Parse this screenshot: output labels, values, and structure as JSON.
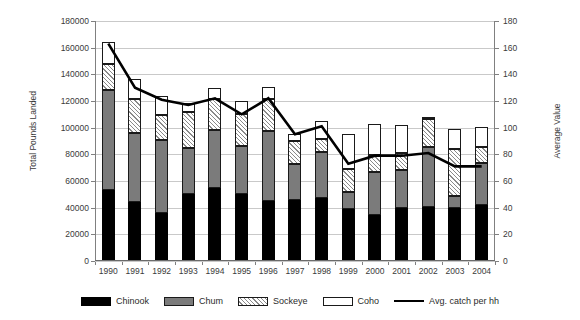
{
  "chart_data": {
    "type": "bar",
    "title": "",
    "subtitle": "",
    "xlabel": "",
    "ylabel": "Total Pounds Landed",
    "y2label": "Average Value",
    "ylim": [
      0,
      180000
    ],
    "y2lim": [
      0,
      180
    ],
    "grid": true,
    "legend_position": "bottom",
    "stacked": true,
    "categories": [
      "1990",
      "1991",
      "1992",
      "1993",
      "1994",
      "1995",
      "1996",
      "1997",
      "1998",
      "1999",
      "2000",
      "2001",
      "2002",
      "2003",
      "2004"
    ],
    "yticks": [
      0,
      20000,
      40000,
      60000,
      80000,
      100000,
      120000,
      140000,
      160000,
      180000
    ],
    "ytick_labels": [
      "0",
      "20000",
      "40000",
      "60000",
      "80000",
      "100000",
      "120000",
      "140000",
      "160000",
      "180000"
    ],
    "y2ticks": [
      0,
      20,
      40,
      60,
      80,
      100,
      120,
      140,
      160,
      180
    ],
    "y2tick_labels": [
      "0",
      "20",
      "40",
      "60",
      "80",
      "100",
      "120",
      "140",
      "160",
      "180"
    ],
    "series": [
      {
        "name": "Chinook",
        "axis": "left",
        "type": "bar",
        "color": "#000000",
        "values": [
          53500,
          44000,
          36000,
          50000,
          55000,
          50000,
          45000,
          46000,
          47000,
          39000,
          34500,
          39500,
          40500,
          39500,
          42000
        ]
      },
      {
        "name": "Chum",
        "axis": "left",
        "type": "bar",
        "color": "#7b7b7b",
        "values": [
          75000,
          52000,
          54500,
          34500,
          43000,
          36500,
          52500,
          26500,
          35000,
          13000,
          32500,
          28500,
          45000,
          9500,
          31500
        ]
      },
      {
        "name": "Sockeye",
        "axis": "left",
        "type": "bar",
        "color": "#ffffff-hatched",
        "values": [
          19500,
          25500,
          19000,
          27000,
          23500,
          24000,
          24000,
          17500,
          9500,
          17000,
          12500,
          13000,
          21000,
          35000,
          12000
        ]
      },
      {
        "name": "Coho",
        "axis": "left",
        "type": "bar",
        "color": "#ffffff",
        "values": [
          16000,
          15000,
          14000,
          7000,
          8500,
          9500,
          9000,
          5000,
          13500,
          26000,
          23000,
          21000,
          1000,
          15000,
          15000
        ]
      },
      {
        "name": "Avg. catch per hh",
        "axis": "right",
        "type": "line",
        "color": "#000000",
        "values": [
          163,
          130,
          121,
          117,
          122,
          110,
          122,
          95,
          101,
          73,
          79,
          79,
          81,
          71,
          71
        ]
      }
    ],
    "bar_totals": [
      164000,
      136500,
      123500,
      118500,
      130000,
      120000,
      130500,
      95000,
      105000,
      95000,
      102500,
      102000,
      107500,
      99000,
      100500
    ]
  },
  "legend": {
    "items": [
      {
        "label": "Chinook",
        "swatch": "chinook"
      },
      {
        "label": "Chum",
        "swatch": "chum"
      },
      {
        "label": "Sockeye",
        "swatch": "sockeye"
      },
      {
        "label": "Coho",
        "swatch": "coho"
      },
      {
        "label": "Avg. catch per hh",
        "swatch": "line"
      }
    ]
  }
}
